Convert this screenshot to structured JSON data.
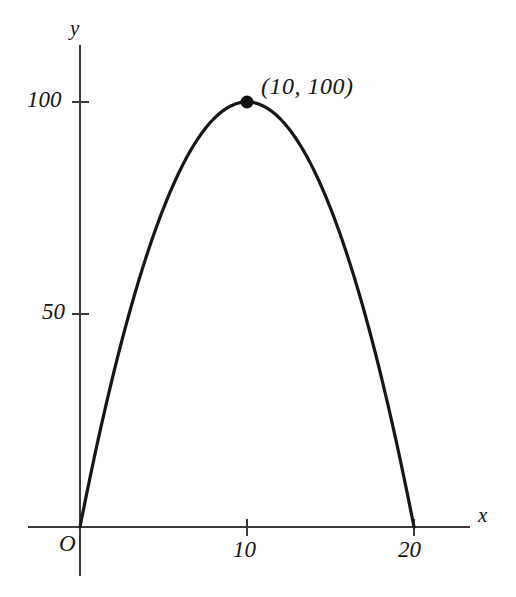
{
  "figure": {
    "background_color": "#ffffff",
    "ink_color": "#161616",
    "axis_color": "#3a3a3a"
  },
  "axes": {
    "x_axis_name": "x",
    "y_axis_name": "y",
    "origin_label": "O"
  },
  "labels": {
    "y_tick_100": "100",
    "y_tick_50": "50",
    "x_tick_10": "10",
    "x_tick_20": "20",
    "vertex_annotation": "(10, 100)"
  },
  "chart_data": {
    "type": "line",
    "title": "",
    "subtitle": "",
    "xlabel": "x",
    "ylabel": "y",
    "equation": "y = 20x - x^2",
    "grid": false,
    "legend": false,
    "legend_position": "none",
    "xlim": [
      -1.2,
      23.4
    ],
    "ylim": [
      -14.1,
      113.5
    ],
    "xticks": [
      10,
      20
    ],
    "xtick_labels": [
      "10",
      "20"
    ],
    "yticks": [
      50,
      100
    ],
    "ytick_labels": [
      "50",
      "100"
    ],
    "origin_label": "O",
    "annotations": [
      {
        "text": "(10, 100)",
        "x": 10,
        "y": 100,
        "marker": "filled-circle",
        "marker_size": 7
      }
    ],
    "series": [
      {
        "name": "y = 20x - x^2",
        "color": "#161616",
        "x": [
          0,
          1,
          2,
          3,
          4,
          5,
          6,
          7,
          8,
          9,
          10,
          11,
          12,
          13,
          14,
          15,
          16,
          17,
          18,
          19,
          20
        ],
        "values": [
          0,
          19,
          36,
          51,
          64,
          75,
          84,
          91,
          96,
          99,
          100,
          99,
          96,
          91,
          84,
          75,
          64,
          51,
          36,
          19,
          0
        ]
      }
    ],
    "roots": [
      0,
      20
    ],
    "vertex": [
      10,
      100
    ]
  }
}
